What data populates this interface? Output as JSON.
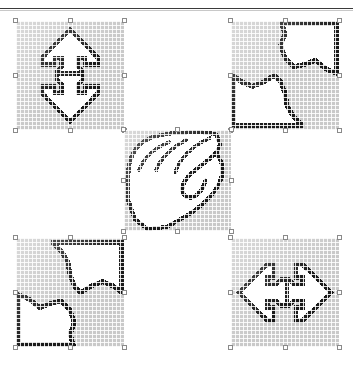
{
  "document": {
    "title": "Pixel Shape Canvas",
    "background_color": "#ffffff",
    "rule_color": "#3a3a3a"
  },
  "palette": {
    "bitmap_fill": "#c9c9c9",
    "shape_interior": "#ffffff",
    "outline": "#1a1a1a",
    "gridline": "#ffffff",
    "handle_fill": "#ffffff",
    "handle_border": "#8a8a8a"
  },
  "canvas": {
    "width": 353,
    "height": 367,
    "layout": "quincunx",
    "object_count": 5
  },
  "objects": [
    {
      "id": "obj-top-left",
      "name": "double-arrow-vertical",
      "description": "Two opposing arrowhead shapes pointing up and down, joined at a narrow waist",
      "x": 16,
      "y": 21,
      "width": 108,
      "height": 109,
      "selected": true,
      "rotation_deg": 0,
      "handles": 8
    },
    {
      "id": "obj-top-right",
      "name": "s-curve-split",
      "description": "Diagonal S-shaped curve splitting the tile into light and dark regions with a heavy top and right border",
      "x": 231,
      "y": 21,
      "width": 108,
      "height": 109,
      "selected": true,
      "rotation_deg": 0,
      "handles": 8
    },
    {
      "id": "obj-center",
      "name": "hand-outline",
      "description": "Outline of a hand with four fingers and a curled thumb",
      "x": 124,
      "y": 130,
      "width": 107,
      "height": 101,
      "selected": true,
      "rotation_deg": 0,
      "handles": 8
    },
    {
      "id": "obj-bottom-left",
      "name": "s-curve-split-rotated",
      "description": "Rotated copy of the S-curve split tile, heavy border on top and bottom edges",
      "x": 16,
      "y": 238,
      "width": 108,
      "height": 109,
      "selected": true,
      "rotation_deg": 180,
      "handles": 8
    },
    {
      "id": "obj-bottom-right",
      "name": "double-arrow-horizontal",
      "description": "Two opposing arrowhead shapes pointing left and right, joined at a narrow waist",
      "x": 231,
      "y": 238,
      "width": 108,
      "height": 109,
      "selected": true,
      "rotation_deg": 90,
      "handles": 8
    }
  ]
}
